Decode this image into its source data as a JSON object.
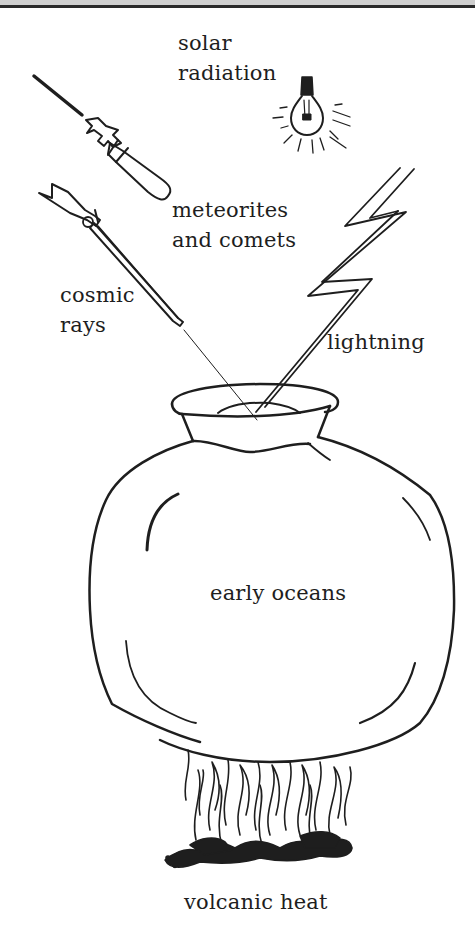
{
  "diagram": {
    "title": "",
    "labels": {
      "solar_radiation": "solar\nradiation",
      "meteorites": "meteorites\nand comets",
      "cosmic_rays": "cosmic\nrays",
      "lightning": "lightning",
      "early_oceans": "early oceans",
      "volcanic_heat": "volcanic heat"
    },
    "icons": [
      "light-bulb-icon",
      "bomb-icon",
      "rifle-icon",
      "lightning-bolt-icon",
      "pot-icon",
      "fire-icon"
    ],
    "colors": {
      "ink": "#1e1e1e",
      "background": "#ffffff",
      "border": "#2a2a2a"
    }
  }
}
